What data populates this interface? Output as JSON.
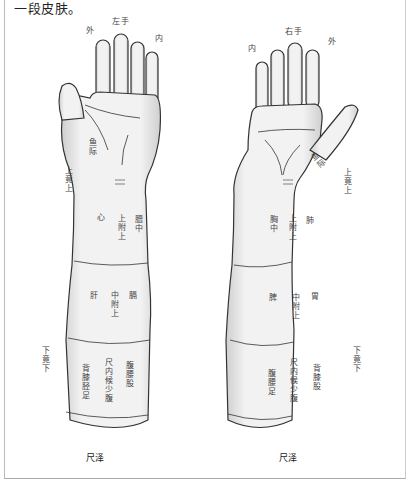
{
  "intro_text": "一段皮肤。",
  "left_arm": {
    "hand_label": "左手",
    "outer_label": "外",
    "inner_label": "内",
    "thenar_label": "鱼际",
    "side_upper_label": "上竟上",
    "side_lower_label": "下竟下",
    "upper_section": {
      "left": "心",
      "middle": "上附上",
      "right": "膻中"
    },
    "middle_section": {
      "left": "肝",
      "middle": "中附上",
      "right": "膈"
    },
    "lower_section": {
      "left": "背膝胫足",
      "middle": "尺内候少腹",
      "right": "腹腰股"
    },
    "bottom_caption": "尺泽"
  },
  "right_arm": {
    "hand_label": "右手",
    "outer_label": "外",
    "inner_label": "内",
    "thenar_label": "鱼际",
    "side_upper_label": "上竟上",
    "side_lower_label": "下竟下",
    "upper_section": {
      "left": "胸中",
      "middle": "上附上",
      "right": "肺"
    },
    "middle_section": {
      "left": "脾",
      "middle": "中附上",
      "right": "胃"
    },
    "lower_section": {
      "left": "腹腰足",
      "middle": "尺内候少腹",
      "right": "背膝股"
    },
    "bottom_caption": "尺泽"
  },
  "colors": {
    "skin_fill": "#ececec",
    "outline": "#333333",
    "frame": "#bbbbbb"
  }
}
